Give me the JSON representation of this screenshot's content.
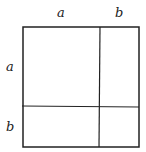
{
  "diagram": {
    "title": "",
    "top_labels": [
      "a",
      "b"
    ],
    "left_labels": [
      "a",
      "b"
    ],
    "colors": {
      "stroke": "#222222",
      "background": "#ffffff"
    }
  }
}
